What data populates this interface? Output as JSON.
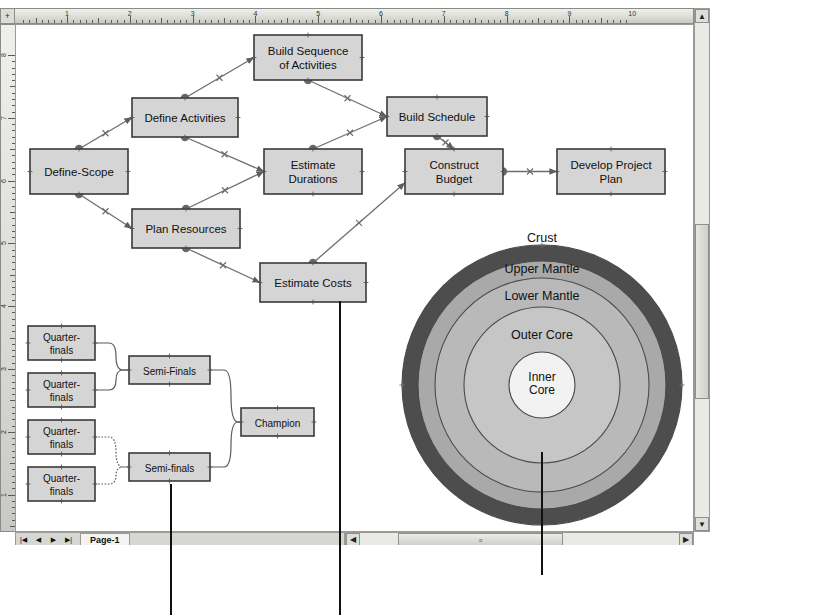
{
  "app": {
    "ruler_h_labels": [
      "1",
      "2",
      "3",
      "4",
      "5",
      "6",
      "7",
      "8",
      "9",
      "10"
    ],
    "ruler_v_labels": [
      "8",
      "7",
      "6",
      "5",
      "4",
      "3",
      "2",
      "1"
    ],
    "ruler_corner_glyph": "+",
    "page_tab_label": "Page-1",
    "nav_first": "|◀",
    "nav_prev": "◀",
    "nav_next": "▶",
    "nav_last": "▶|",
    "scroll_up": "▲",
    "scroll_down": "▼",
    "scroll_left": "◀",
    "scroll_right": "▶",
    "scroll_grip": "≡"
  },
  "flowchart": {
    "title": "Project planning flowchart",
    "nodes": [
      {
        "id": "define-scope",
        "label": "Define-Scope",
        "x": 29,
        "y": 148,
        "w": 98,
        "h": 45
      },
      {
        "id": "define-activities",
        "label": "Define Activities",
        "x": 131,
        "y": 97,
        "w": 106,
        "h": 39
      },
      {
        "id": "build-sequence",
        "label": "Build Sequence\nof Activities",
        "x": 253,
        "y": 34,
        "w": 108,
        "h": 45
      },
      {
        "id": "estimate-durations",
        "label": "Estimate\nDurations",
        "x": 263,
        "y": 148,
        "w": 98,
        "h": 45
      },
      {
        "id": "plan-resources",
        "label": "Plan Resources",
        "x": 131,
        "y": 208,
        "w": 108,
        "h": 39
      },
      {
        "id": "estimate-costs",
        "label": "Estimate Costs",
        "x": 259,
        "y": 262,
        "w": 106,
        "h": 39
      },
      {
        "id": "build-schedule",
        "label": "Build Schedule",
        "x": 386,
        "y": 96,
        "w": 100,
        "h": 39
      },
      {
        "id": "construct-budget",
        "label": "Construct\nBudget",
        "x": 404,
        "y": 148,
        "w": 98,
        "h": 45
      },
      {
        "id": "develop-project-plan",
        "label": "Develop Project\nPlan",
        "x": 556,
        "y": 148,
        "w": 108,
        "h": 45
      }
    ],
    "edges": [
      {
        "from": "define-scope",
        "to": "define-activities"
      },
      {
        "from": "define-scope",
        "to": "plan-resources"
      },
      {
        "from": "define-activities",
        "to": "build-sequence"
      },
      {
        "from": "define-activities",
        "to": "estimate-durations"
      },
      {
        "from": "plan-resources",
        "to": "estimate-durations"
      },
      {
        "from": "plan-resources",
        "to": "estimate-costs"
      },
      {
        "from": "build-sequence",
        "to": "build-schedule"
      },
      {
        "from": "estimate-durations",
        "to": "build-schedule"
      },
      {
        "from": "build-schedule",
        "to": "construct-budget"
      },
      {
        "from": "estimate-costs",
        "to": "construct-budget"
      },
      {
        "from": "construct-budget",
        "to": "develop-project-plan"
      }
    ]
  },
  "bracket": {
    "title": "Tournament bracket",
    "nodes": [
      {
        "id": "qf1",
        "label": "Quarter-\nfinals",
        "x": 27,
        "y": 325,
        "w": 67,
        "h": 34
      },
      {
        "id": "qf2",
        "label": "Quarter-\nfinals",
        "x": 27,
        "y": 372,
        "w": 67,
        "h": 34
      },
      {
        "id": "qf3",
        "label": "Quarter-\nfinals",
        "x": 27,
        "y": 419,
        "w": 67,
        "h": 34
      },
      {
        "id": "qf4",
        "label": "Quarter-\nfinals",
        "x": 27,
        "y": 466,
        "w": 67,
        "h": 34
      },
      {
        "id": "sf1",
        "label": "Semi-Finals",
        "x": 128,
        "y": 355,
        "w": 81,
        "h": 28
      },
      {
        "id": "sf2",
        "label": "Semi-finals",
        "x": 128,
        "y": 452,
        "w": 81,
        "h": 28
      },
      {
        "id": "champ",
        "label": "Champion",
        "x": 240,
        "y": 407,
        "w": 73,
        "h": 28
      }
    ]
  },
  "onion": {
    "title": "Onion diagram of Earth layers",
    "center_x": 541,
    "center_y": 384,
    "layers": [
      {
        "name": "Crust",
        "radius": 140,
        "fill": "#4d4d4d",
        "label_x": 541,
        "label_y": 237,
        "label_outside": true
      },
      {
        "name": "Upper Mantle",
        "radius": 124,
        "fill": "#a9a9a9",
        "label_x": 541,
        "label_y": 268
      },
      {
        "name": "Lower Mantle",
        "radius": 107,
        "fill": "#b9b9b9",
        "label_x": 541,
        "label_y": 295
      },
      {
        "name": "Outer Core",
        "radius": 78,
        "fill": "#c6c6c6",
        "label_x": 541,
        "label_y": 334
      },
      {
        "name": "Inner Core",
        "radius": 33,
        "fill": "#f2f2f2",
        "label_x": 541,
        "label_y": 382
      }
    ]
  },
  "caption": {
    "text": "Onion diagrams show layers building from a core.",
    "leader_lines": [
      {
        "id": "leader-bracket",
        "x": 170,
        "y": 484,
        "height": 131
      },
      {
        "id": "leader-flowchart",
        "x": 339,
        "y": 301,
        "height": 314
      },
      {
        "id": "leader-onion",
        "x": 541,
        "y": 452,
        "height": 123
      }
    ]
  },
  "colors": {
    "node_fill": "#d5d5d5",
    "node_border": "#3a3a3a",
    "connector": "#6e6e6e",
    "bracket_fill": "#d5d5d5"
  }
}
